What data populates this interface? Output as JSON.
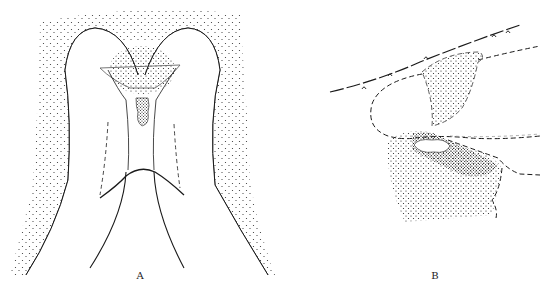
{
  "figure": {
    "panels": [
      {
        "id": "A",
        "label": "A",
        "label_x": 140,
        "label_y": 278
      },
      {
        "id": "B",
        "label": "B",
        "label_x": 435,
        "label_y": 278
      }
    ],
    "colors": {
      "ink": "#1a1a1a",
      "background": "#ffffff"
    }
  }
}
